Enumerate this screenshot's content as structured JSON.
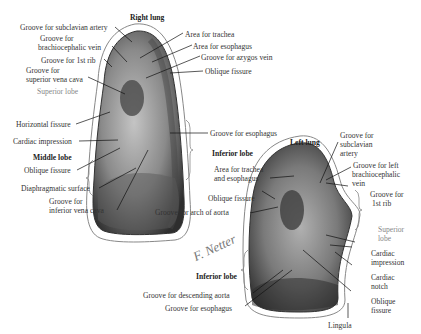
{
  "title_right": "Right lung",
  "title_left": "Left lung",
  "signature": "F. Netter",
  "colors": {
    "lung_dark": "#3a3a3a",
    "lung_mid": "#7a7a7a",
    "lung_light": "#b8b8b8",
    "outline": "#888888",
    "gray_label": "#888888"
  },
  "right_lung_labels": {
    "subclavian_artery": "Groove for subclavian artery",
    "brachiocephalic_1": "Groove for",
    "brachiocephalic_2": "brachiocephalic vein",
    "first_rib": "Groove for 1st rib",
    "svc_1": "Groove for",
    "svc_2": "superior vena cava",
    "superior_lobe": "Superior lobe",
    "trachea": "Area for trachea",
    "esophagus_area": "Area for esophagus",
    "azygos": "Groove for azygos vein",
    "oblique_fissure": "Oblique fissure",
    "horizontal_fissure": "Horizontal fissure",
    "cardiac_impression": "Cardiac impression",
    "middle_lobe": "Middle lobe",
    "oblique_fissure_2": "Oblique fissure",
    "diaphragmatic": "Diaphragmatic surface",
    "ivc_1": "Groove for",
    "ivc_2": "inferior vena cava",
    "esophagus_groove": "Groove for esophagus",
    "inferior_lobe": "Inferior lobe"
  },
  "left_lung_labels": {
    "subclavian_1": "Groove for",
    "subclavian_2": "subclavian",
    "subclavian_3": "artery",
    "brachio_1": "Groove for left",
    "brachio_2": "brachiocephalic",
    "brachio_3": "vein",
    "rib_1": "Groove for",
    "rib_2": "1st rib",
    "trachea_1": "Area for trachea",
    "trachea_2": "and esophagus",
    "oblique_fissure": "Oblique fissure",
    "arch_aorta": "Groove for arch of aorta",
    "superior_lobe_1": "Superior",
    "superior_lobe_2": "lobe",
    "cardiac_imp_1": "Cardiac",
    "cardiac_imp_2": "impression",
    "cardiac_notch_1": "Cardiac",
    "cardiac_notch_2": "notch",
    "oblique_2_1": "Oblique",
    "oblique_2_2": "fissure",
    "inferior_lobe": "Inferior lobe",
    "descending_aorta": "Groove for descending aorta",
    "esophagus": "Groove for esophagus",
    "lingula": "Lingula"
  }
}
